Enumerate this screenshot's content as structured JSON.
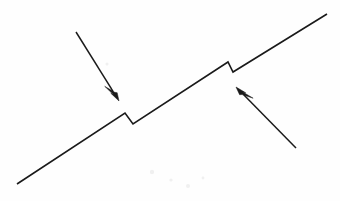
{
  "figure": {
    "title": "Rising line with two downward step discontinuities and two annotation arrows",
    "width": 340,
    "height": 201,
    "background_color": "#fefefe",
    "ink_color": "#1a1a1a"
  },
  "chart_data": {
    "type": "line",
    "title": "",
    "xlabel": "",
    "ylabel": "",
    "grid": false,
    "legend": null,
    "xlim": [
      0,
      340
    ],
    "ylim": [
      0,
      201
    ],
    "series": [
      {
        "name": "stepped-rising-line",
        "stroke": "#1a1a1a",
        "points": [
          [
            17,
            184
          ],
          [
            125,
            113
          ],
          [
            133,
            124
          ],
          [
            228,
            62
          ],
          [
            233,
            72
          ],
          [
            327,
            14
          ]
        ]
      }
    ],
    "annotations": [
      {
        "name": "arrow-upper-left",
        "kind": "arrow",
        "direction": "down-right",
        "tail": [
          76,
          32
        ],
        "tip": [
          119,
          101
        ],
        "points_at": "first-step-discontinuity"
      },
      {
        "name": "arrow-lower-right",
        "kind": "arrow",
        "direction": "up-left",
        "tail": [
          296,
          148
        ],
        "tip": [
          236,
          87
        ],
        "points_at": "second-step-discontinuity"
      }
    ],
    "features": [
      {
        "name": "first-step-discontinuity",
        "peak": [
          125,
          113
        ],
        "bottom": [
          133,
          124
        ],
        "drop": 11
      },
      {
        "name": "second-step-discontinuity",
        "peak": [
          228,
          62
        ],
        "bottom": [
          233,
          72
        ],
        "drop": 10
      }
    ]
  }
}
